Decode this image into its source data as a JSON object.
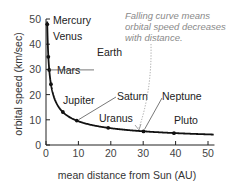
{
  "chart_data": {
    "type": "line",
    "title": "",
    "xlabel": "mean distance from Sun (AU)",
    "ylabel": "orbital speed (km/sec)",
    "xlim": [
      0,
      52
    ],
    "ylim": [
      0,
      50
    ],
    "x_ticks": [
      0,
      10,
      20,
      30,
      40,
      50
    ],
    "y_ticks": [
      0,
      10,
      20,
      30,
      40,
      50
    ],
    "grid": false,
    "series": [
      {
        "name": "planets",
        "points": [
          {
            "label": "Mercury",
            "x": 0.39,
            "y": 47.9
          },
          {
            "label": "Venus",
            "x": 0.72,
            "y": 35.0
          },
          {
            "label": "Earth",
            "x": 1.0,
            "y": 29.8
          },
          {
            "label": "Mars",
            "x": 1.52,
            "y": 24.1
          },
          {
            "label": "Jupiter",
            "x": 5.2,
            "y": 13.1
          },
          {
            "label": "Saturn",
            "x": 9.5,
            "y": 9.7
          },
          {
            "label": "Uranus",
            "x": 19.2,
            "y": 6.8
          },
          {
            "label": "Neptune",
            "x": 30.1,
            "y": 5.4
          },
          {
            "label": "Pluto",
            "x": 39.5,
            "y": 4.7
          }
        ]
      }
    ],
    "annotations": [
      {
        "text": [
          "Falling curve means",
          "orbital speed decreases",
          "with distance."
        ],
        "points_to": {
          "x": 28,
          "y": 6
        }
      }
    ]
  },
  "colors": {
    "curve": "#111111",
    "axis": "#222222",
    "annotation": "#8a8a8a",
    "leader": "#555555",
    "text": "#222222"
  }
}
